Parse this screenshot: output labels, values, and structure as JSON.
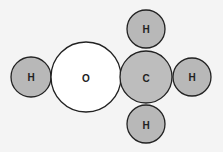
{
  "diagram": {
    "colors": {
      "background": "#f4f4f4",
      "hydrogen": "#b8b8b8",
      "carbon": "#bdbdbd",
      "oxygen": "#ffffff",
      "outline": "#222222"
    },
    "atoms": [
      {
        "id": "h-left",
        "label": "H",
        "element": "hydrogen"
      },
      {
        "id": "o",
        "label": "O",
        "element": "oxygen"
      },
      {
        "id": "c",
        "label": "C",
        "element": "carbon"
      },
      {
        "id": "h-top",
        "label": "H",
        "element": "hydrogen"
      },
      {
        "id": "h-right",
        "label": "H",
        "element": "hydrogen"
      },
      {
        "id": "h-bottom",
        "label": "H",
        "element": "hydrogen"
      }
    ]
  }
}
